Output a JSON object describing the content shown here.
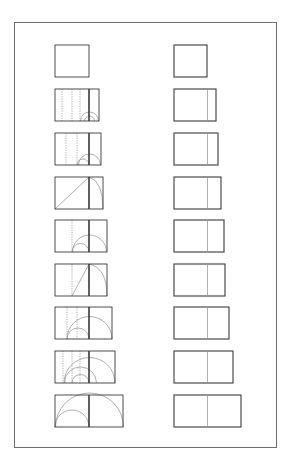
{
  "diagram": {
    "colors": {
      "background": "#ffffff",
      "frame": "#6e6e6e",
      "stroke_dark": "#3a3a3a",
      "stroke_light": "#9a9a9a",
      "dotted": "#8a8a8a"
    },
    "frame": {
      "x": 14,
      "y": 22,
      "w": 263,
      "h": 426
    },
    "square_side": 34,
    "row_height": 32,
    "rows_y": [
      45,
      89,
      133,
      177,
      220,
      264,
      307,
      351,
      395
    ],
    "left_column": {
      "x": 55,
      "figures": [
        {
          "row": 1,
          "width": 34,
          "construction": "square"
        },
        {
          "row": 2,
          "width": 44,
          "construction": "dotted-verticals-small-arcs",
          "dotted_x": [
            62,
            72,
            80
          ],
          "arcs": [
            {
              "cx": 89.5,
              "r": 5
            },
            {
              "cx": 89.5,
              "r": 9
            }
          ]
        },
        {
          "row": 3,
          "width": 46,
          "construction": "dotted-verticals-arcs",
          "dotted_x": [
            66,
            77
          ],
          "arcs": [
            {
              "cx": 83,
              "r": 6
            },
            {
              "cx": 89.5,
              "r": 11
            }
          ]
        },
        {
          "row": 4,
          "width": 48,
          "construction": "diagonal-and-quarter-arc",
          "diagonal": true,
          "quarter_arc": true
        },
        {
          "row": 5,
          "width": 52,
          "construction": "dotted-vertical-arcs",
          "dotted_x": [
            72
          ],
          "arcs": [
            {
              "cx": 80.5,
              "r": 8.5
            },
            {
              "cx": 89.5,
              "r": 17
            }
          ]
        },
        {
          "row": 6,
          "width": 52,
          "construction": "diagonal-from-dotted-and-quarter-arc",
          "dotted_x": [
            72
          ],
          "diagonal": true,
          "quarter_arc": true
        },
        {
          "row": 7,
          "width": 57,
          "construction": "dotted-verticals-arcs",
          "dotted_x": [
            67,
            77
          ],
          "arcs": [
            {
              "cx": 78,
              "r": 11
            },
            {
              "cx": 89.5,
              "r": 22.5
            }
          ]
        },
        {
          "row": 8,
          "width": 60,
          "construction": "dotted-verticals-arcs",
          "dotted_x": [
            63,
            72,
            80
          ],
          "arcs": [
            {
              "cx": 80.5,
              "r": 8.5
            },
            {
              "cx": 80.5,
              "r": 16
            },
            {
              "cx": 89.5,
              "r": 25.5
            }
          ]
        },
        {
          "row": 9,
          "width": 68,
          "construction": "double-square-arcs",
          "arcs": [
            {
              "cx": 72,
              "r": 17
            },
            {
              "cx": 89.5,
              "r": 34
            }
          ]
        }
      ]
    },
    "right_column": {
      "x": 174,
      "figures": [
        {
          "row": 1,
          "width": 33
        },
        {
          "row": 2,
          "width": 42
        },
        {
          "row": 3,
          "width": 44
        },
        {
          "row": 4,
          "width": 47
        },
        {
          "row": 5,
          "width": 50
        },
        {
          "row": 6,
          "width": 51
        },
        {
          "row": 7,
          "width": 55
        },
        {
          "row": 8,
          "width": 59
        },
        {
          "row": 9,
          "width": 67
        }
      ]
    }
  }
}
